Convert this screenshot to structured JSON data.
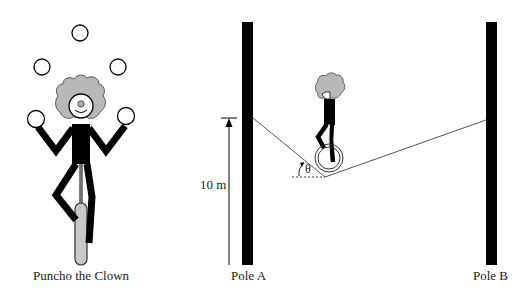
{
  "labels": {
    "clown": "Puncho the Clown",
    "pole_a": "Pole A",
    "pole_b": "Pole B",
    "height": "10 m",
    "angle": "θ"
  },
  "colors": {
    "ink": "#000000",
    "hair": "#b8b8b8",
    "wheel_fill": "#c8c8c8",
    "rope": "#555555",
    "background": "#ffffff"
  },
  "figures": {
    "juggling_clown": {
      "balls": 5,
      "on_unicycle": true
    },
    "tightrope": {
      "pole_height_label": "10 m",
      "sag_angle_symbol": "θ",
      "rider": "clown on unicycle"
    }
  }
}
